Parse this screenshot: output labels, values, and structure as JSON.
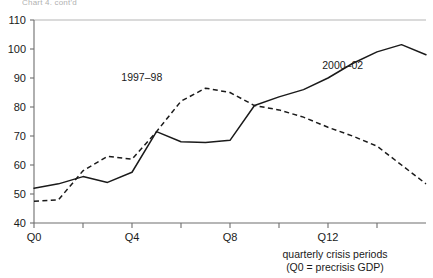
{
  "top_caption": "Chart 4. cont'd",
  "chart_data": {
    "type": "line",
    "title": "",
    "subtitle": "",
    "xlabel_line1": "quarterly crisis periods",
    "xlabel_line2": "(Q0 = precrisis GDP)",
    "ylabel": "",
    "grid": false,
    "legend_position": "inline-annotation",
    "xlim": [
      0,
      16
    ],
    "ylim": [
      40,
      110
    ],
    "yticks": [
      40,
      50,
      60,
      70,
      80,
      90,
      100,
      110
    ],
    "ytick_labels": [
      "40",
      "50",
      "60",
      "70",
      "80",
      "90",
      "100",
      "110"
    ],
    "xticks": [
      0,
      2,
      4,
      6,
      8,
      10,
      12,
      14
    ],
    "xtick_labels": [
      "Q0",
      "",
      "Q4",
      "",
      "Q8",
      "",
      "Q12",
      ""
    ],
    "x": [
      0,
      1,
      2,
      3,
      4,
      5,
      6,
      7,
      8,
      9,
      10,
      11,
      12,
      13,
      14,
      15,
      16
    ],
    "series": [
      {
        "name": "1997-98",
        "label": "1997–98",
        "style": "dashed",
        "values": [
          47.5,
          48.0,
          58.0,
          63.0,
          62.0,
          71.5,
          82.0,
          86.5,
          85.0,
          80.5,
          79.0,
          76.5,
          73.0,
          70.0,
          66.5,
          60.0,
          53.5
        ]
      },
      {
        "name": "2000-02",
        "label": "2000–02",
        "style": "solid",
        "values": [
          52.0,
          53.5,
          56.0,
          54.0,
          57.5,
          71.5,
          68.0,
          67.8,
          68.5,
          80.5,
          83.5,
          86.0,
          90.0,
          95.0,
          99.0,
          101.5,
          98.0
        ]
      }
    ],
    "annotations": [
      {
        "text": "1997–98",
        "x_value": 4.4,
        "y_value": 89.0
      },
      {
        "text": "2000–02",
        "x_value": 12.6,
        "y_value": 93.0
      }
    ]
  }
}
